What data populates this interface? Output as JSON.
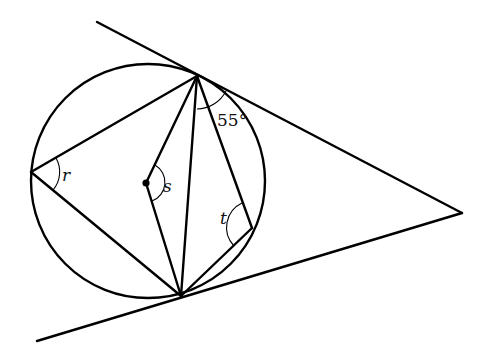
{
  "diagram": {
    "colors": {
      "stroke": "#000000",
      "background": "#ffffff"
    },
    "circle": {
      "cx": 148,
      "cy": 181,
      "r": 117
    },
    "points": {
      "external": {
        "x": 462,
        "y": 213
      },
      "top_tangent": {
        "x": 197,
        "y": 76
      },
      "bottom_tangent": {
        "x": 181,
        "y": 296
      },
      "left": {
        "x": 31,
        "y": 172
      },
      "right": {
        "x": 252,
        "y": 228
      },
      "center": {
        "x": 146,
        "y": 183
      }
    },
    "labels": {
      "angle_55": "55°",
      "r": "r",
      "s": "s",
      "t": "t"
    }
  }
}
